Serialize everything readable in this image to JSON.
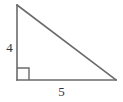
{
  "figure": {
    "kind": "right-triangle-diagram",
    "background_color": "#ffffff",
    "stroke_color": "#6b6b6b",
    "label_color": "#333333",
    "canvas": {
      "width": 123,
      "height": 102
    },
    "vertices": {
      "top": {
        "x": 17,
        "y": 5
      },
      "bottom_left": {
        "x": 17,
        "y": 80
      },
      "bottom_right": {
        "x": 116,
        "y": 80
      }
    },
    "right_angle_marker": {
      "at_vertex": "bottom_left",
      "size": 12,
      "x": 17,
      "y": 68
    },
    "labels": {
      "vertical_leg": "4",
      "horizontal_leg": "5"
    }
  }
}
